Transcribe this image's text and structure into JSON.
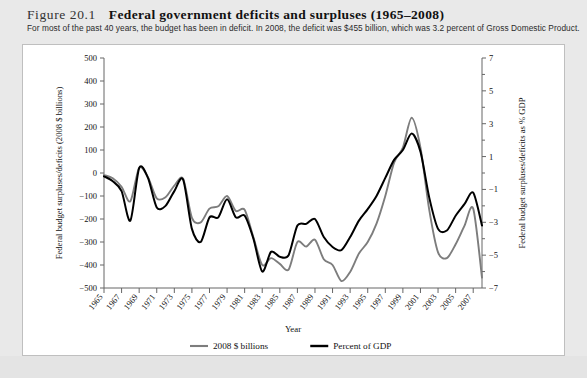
{
  "figure": {
    "number": "Figure 20.1",
    "title": "Federal government deficits and surpluses (1965–2008)",
    "subtitle": "For most of the past 40 years, the budget has been in deficit. In 2008, the deficit was $455 billion, which was 3.2 percent of Gross Domestic Product."
  },
  "colors": {
    "series_billions": "#7d7d7d",
    "series_gdp": "#000000",
    "panel_background": "#ffffff",
    "page_background": "#e9e9e9",
    "axis": "#666666"
  },
  "chart_data": {
    "type": "line",
    "title": "Federal government deficits and surpluses (1965–2008)",
    "xlabel": "Year",
    "ylabel": "Federal budget surpluses/deficits (2008 $ billions)",
    "y2label": "Federal budget surpluses/deficits as % GDP",
    "xlim": [
      1965,
      2008
    ],
    "ylim": [
      -500,
      500
    ],
    "y2lim": [
      -7,
      7
    ],
    "grid": false,
    "legend_position": "bottom-center",
    "ytick_labels": [
      "500",
      "400",
      "300",
      "200",
      "100",
      "0",
      "−100",
      "−200",
      "−300",
      "−400",
      "−500"
    ],
    "ytick_values": [
      500,
      400,
      300,
      200,
      100,
      0,
      -100,
      -200,
      -300,
      -400,
      -500
    ],
    "y2tick_labels": [
      "7",
      "5",
      "3",
      "1",
      "−1",
      "−3",
      "−5",
      "−7"
    ],
    "y2tick_values": [
      7,
      5,
      3,
      1,
      -1,
      -3,
      -5,
      -7
    ],
    "y2minor_values": [
      6,
      4,
      2,
      0,
      -2,
      -4,
      -6
    ],
    "xtick_labels": [
      "1965",
      "1967",
      "1969",
      "1971",
      "1973",
      "1975",
      "1977",
      "1979",
      "1981",
      "1983",
      "1985",
      "1987",
      "1989",
      "1991",
      "1993",
      "1995",
      "1997",
      "1999",
      "2001",
      "2003",
      "2005",
      "2007"
    ],
    "xtick_values": [
      1965,
      1967,
      1969,
      1971,
      1973,
      1975,
      1977,
      1979,
      1981,
      1983,
      1985,
      1987,
      1989,
      1991,
      1993,
      1995,
      1997,
      1999,
      2001,
      2003,
      2005,
      2007
    ],
    "x": [
      1965,
      1966,
      1967,
      1968,
      1969,
      1970,
      1971,
      1972,
      1973,
      1974,
      1975,
      1976,
      1977,
      1978,
      1979,
      1980,
      1981,
      1982,
      1983,
      1984,
      1985,
      1986,
      1987,
      1988,
      1989,
      1990,
      1991,
      1992,
      1993,
      1994,
      1995,
      1996,
      1997,
      1998,
      1999,
      2000,
      2001,
      2002,
      2003,
      2004,
      2005,
      2006,
      2007,
      2008
    ],
    "series": [
      {
        "name": "2008 $ billions",
        "color": "#7d7d7d",
        "axis": "left",
        "units": "2008 $ billions",
        "values": [
          -9,
          -23,
          -60,
          -123,
          23,
          -18,
          -110,
          -105,
          -55,
          -25,
          -195,
          -215,
          -155,
          -145,
          -100,
          -165,
          -160,
          -280,
          -400,
          -370,
          -395,
          -420,
          -300,
          -320,
          -290,
          -375,
          -400,
          -470,
          -430,
          -350,
          -300,
          -220,
          -100,
          45,
          110,
          240,
          110,
          -160,
          -345,
          -370,
          -310,
          -230,
          -155,
          -455
        ]
      },
      {
        "name": "Percent of GDP",
        "color": "#000000",
        "axis": "right",
        "units": "percent of GDP",
        "values": [
          -0.2,
          -0.5,
          -1.1,
          -2.9,
          0.3,
          -0.3,
          -2.1,
          -2.0,
          -1.1,
          -0.4,
          -3.4,
          -4.2,
          -2.7,
          -2.7,
          -1.6,
          -2.7,
          -2.6,
          -4.0,
          -6.0,
          -4.8,
          -5.1,
          -5.0,
          -3.2,
          -3.1,
          -2.8,
          -3.9,
          -4.5,
          -4.7,
          -3.9,
          -2.9,
          -2.2,
          -1.4,
          -0.3,
          0.8,
          1.4,
          2.4,
          1.3,
          -1.5,
          -3.4,
          -3.5,
          -2.6,
          -1.9,
          -1.2,
          -3.2
        ]
      }
    ],
    "legend": [
      {
        "label": "2008 $ billions",
        "color": "#7d7d7d"
      },
      {
        "label": "Percent of GDP",
        "color": "#000000"
      }
    ]
  }
}
